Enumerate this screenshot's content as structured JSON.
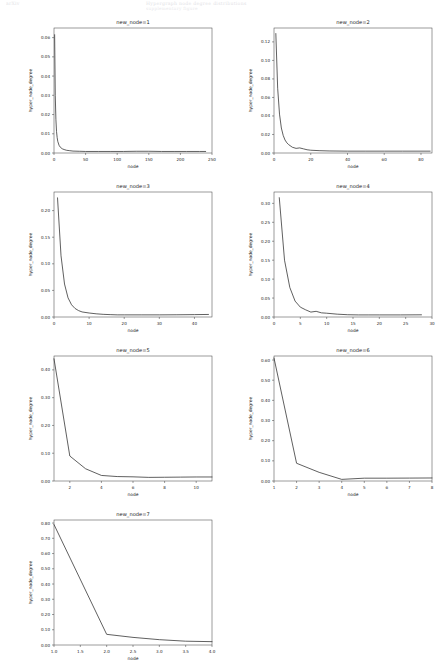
{
  "header": {
    "left_text": "arXiv",
    "right_text": "Hypergraph node degree distributions",
    "sub_text": "supplementary figure"
  },
  "figure": {
    "panel_count": 7,
    "shared_xlabel": "node",
    "shared_ylabel": "hyper_node_degree",
    "line_color": "#2b2b2b",
    "axis_color": "#3a3a3a"
  },
  "chart_data": [
    {
      "type": "line",
      "title": "new_node=1",
      "xlabel": "node",
      "ylabel": "hyper_node_degree",
      "xlim": [
        0,
        250
      ],
      "ylim": [
        0.0,
        0.065
      ],
      "xticks": [
        0,
        50,
        100,
        150,
        200,
        250
      ],
      "yticks": [
        0.0,
        0.01,
        0.02,
        0.03,
        0.04,
        0.05,
        0.06
      ],
      "grid": false,
      "legend": null,
      "x": [
        1,
        2,
        3,
        4,
        5,
        6,
        8,
        10,
        13,
        16,
        20,
        25,
        30,
        40,
        50,
        70,
        90,
        110,
        130,
        150,
        170,
        190,
        210,
        230,
        240
      ],
      "y": [
        0.0615,
        0.03,
        0.0175,
        0.0112,
        0.008,
        0.006,
        0.004,
        0.003,
        0.0022,
        0.0018,
        0.0014,
        0.0012,
        0.001,
        0.0009,
        0.0008,
        0.0008,
        0.0008,
        0.0008,
        0.0009,
        0.0009,
        0.0008,
        0.0008,
        0.0008,
        0.0008,
        0.0008
      ]
    },
    {
      "type": "line",
      "title": "new_node=2",
      "xlabel": "node",
      "ylabel": "hyper_node_degree",
      "xlim": [
        0,
        86
      ],
      "ylim": [
        0.0,
        0.135
      ],
      "xticks": [
        0,
        20,
        40,
        60,
        80
      ],
      "yticks": [
        0.0,
        0.02,
        0.04,
        0.06,
        0.08,
        0.1,
        0.12
      ],
      "grid": false,
      "legend": null,
      "x": [
        1,
        2,
        3,
        4,
        5,
        6,
        7,
        8,
        10,
        12,
        14,
        16,
        18,
        20,
        25,
        30,
        40,
        50,
        60,
        70,
        80,
        85
      ],
      "y": [
        0.129,
        0.07,
        0.042,
        0.027,
        0.019,
        0.014,
        0.011,
        0.009,
        0.0062,
        0.005,
        0.0055,
        0.0045,
        0.0035,
        0.003,
        0.0025,
        0.0022,
        0.002,
        0.002,
        0.002,
        0.002,
        0.002,
        0.002
      ]
    },
    {
      "type": "line",
      "title": "new_node=3",
      "xlabel": "node",
      "ylabel": "hyper_node_degree",
      "xlim": [
        0,
        45
      ],
      "ylim": [
        0.0,
        0.235
      ],
      "xticks": [
        0,
        10,
        20,
        30,
        40
      ],
      "yticks": [
        0.0,
        0.05,
        0.1,
        0.15,
        0.2
      ],
      "grid": false,
      "legend": null,
      "x": [
        1,
        2,
        3,
        4,
        5,
        6,
        7,
        8,
        10,
        12,
        14,
        16,
        18,
        20,
        25,
        30,
        35,
        40,
        44
      ],
      "y": [
        0.224,
        0.115,
        0.062,
        0.036,
        0.023,
        0.016,
        0.012,
        0.0095,
        0.0075,
        0.006,
        0.005,
        0.0045,
        0.004,
        0.004,
        0.004,
        0.004,
        0.0042,
        0.0045,
        0.0048
      ]
    },
    {
      "type": "line",
      "title": "new_node=4",
      "xlabel": "node",
      "ylabel": "hyper_node_degree",
      "xlim": [
        0,
        30
      ],
      "ylim": [
        0.0,
        0.33
      ],
      "xticks": [
        0,
        5,
        10,
        15,
        20,
        25,
        30
      ],
      "yticks": [
        0.0,
        0.05,
        0.1,
        0.15,
        0.2,
        0.25,
        0.3
      ],
      "grid": false,
      "legend": null,
      "x": [
        1,
        2,
        3,
        4,
        5,
        6,
        7,
        8,
        9,
        10,
        12,
        14,
        16,
        18,
        20,
        24,
        28
      ],
      "y": [
        0.315,
        0.15,
        0.078,
        0.042,
        0.026,
        0.019,
        0.013,
        0.015,
        0.011,
        0.01,
        0.0075,
        0.006,
        0.0055,
        0.0055,
        0.0055,
        0.0055,
        0.0058
      ]
    },
    {
      "type": "line",
      "title": "new_node=5",
      "xlabel": "node",
      "ylabel": "hyper_node_degree",
      "xlim": [
        1,
        11
      ],
      "ylim": [
        0.0,
        0.45
      ],
      "xticks": [
        2,
        4,
        6,
        8,
        10
      ],
      "yticks": [
        0.0,
        0.1,
        0.2,
        0.3,
        0.4
      ],
      "grid": false,
      "legend": null,
      "x": [
        1,
        2,
        3,
        4,
        5,
        6,
        7,
        8,
        9,
        10,
        11
      ],
      "y": [
        0.44,
        0.09,
        0.044,
        0.02,
        0.016,
        0.015,
        0.013,
        0.0135,
        0.014,
        0.0145,
        0.0145
      ]
    },
    {
      "type": "line",
      "title": "new_node=6",
      "xlabel": "node",
      "ylabel": "hyper_node_degree",
      "xlim": [
        1,
        8
      ],
      "ylim": [
        0.0,
        0.62
      ],
      "xticks": [
        1,
        2,
        3,
        4,
        5,
        6,
        7,
        8
      ],
      "yticks": [
        0.0,
        0.1,
        0.2,
        0.3,
        0.4,
        0.5,
        0.6
      ],
      "grid": false,
      "legend": null,
      "x": [
        1,
        2,
        3,
        4,
        5,
        6,
        7,
        8
      ],
      "y": [
        0.61,
        0.088,
        0.043,
        0.008,
        0.014,
        0.014,
        0.0145,
        0.015
      ]
    },
    {
      "type": "line",
      "title": "new_node=7",
      "xlabel": "node",
      "ylabel": "hyper_node_degree",
      "xlim": [
        1.0,
        4.0
      ],
      "ylim": [
        0.0,
        0.82
      ],
      "xticks": [
        1.0,
        1.5,
        2.0,
        2.5,
        3.0,
        3.5,
        4.0
      ],
      "xticklabels": [
        "1.0",
        "1.5",
        "2.0",
        "2.5",
        "3.0",
        "3.5",
        "4.0"
      ],
      "yticks": [
        0.0,
        0.1,
        0.2,
        0.3,
        0.4,
        0.5,
        0.6,
        0.7,
        0.8
      ],
      "grid": false,
      "legend": null,
      "x": [
        1.0,
        2.0,
        2.5,
        3.0,
        3.5,
        4.0
      ],
      "y": [
        0.79,
        0.07,
        0.05,
        0.035,
        0.025,
        0.022
      ]
    }
  ]
}
